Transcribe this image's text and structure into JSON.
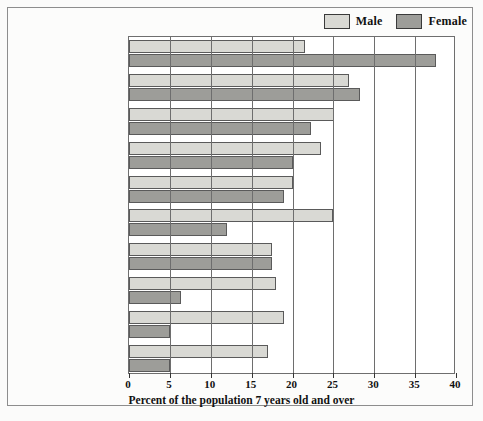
{
  "legend": {
    "items": [
      {
        "label": "Male",
        "color": "#d9d9d4"
      },
      {
        "label": "Female",
        "color": "#9d9d99"
      }
    ]
  },
  "chart_data": {
    "type": "bar",
    "orientation": "horizontal",
    "title": "",
    "xlabel": "Percent of the population 7 years old and over",
    "ylabel": "",
    "xlim": [
      0,
      40
    ],
    "xticks": [
      0,
      5,
      10,
      15,
      20,
      25,
      30,
      35,
      40
    ],
    "grid": true,
    "legend_position": "top-right",
    "categories": [
      "Exercise walking",
      "Swimming",
      "Bicycle riding",
      "Camping",
      "Bowling",
      "Fishing (fresh water)",
      "Exercising with equipment",
      "Basketball",
      "Aerobic exercising",
      "Golf"
    ],
    "series": [
      {
        "name": "Male",
        "color": "#d9d9d4",
        "values": [
          21.5,
          26.9,
          25.1,
          23.5,
          20.1,
          25.0,
          17.5,
          18.0,
          19.0,
          17.0
        ]
      },
      {
        "name": "Female",
        "color": "#9d9d99",
        "values": [
          37.6,
          28.3,
          22.3,
          20.1,
          19.0,
          12.0,
          17.5,
          6.3,
          5.0,
          5.0
        ]
      }
    ]
  },
  "categories_display": [
    [
      "Exercise walking"
    ],
    [
      "Swimming"
    ],
    [
      "Bicycle riding"
    ],
    [
      "Camping"
    ],
    [
      "Bowling"
    ],
    [
      "Fishing (fresh water)"
    ],
    [
      "Exercising with",
      "equipment"
    ],
    [
      "Basketball"
    ],
    [
      "Aerobic exercising"
    ],
    [
      "Golf"
    ]
  ]
}
